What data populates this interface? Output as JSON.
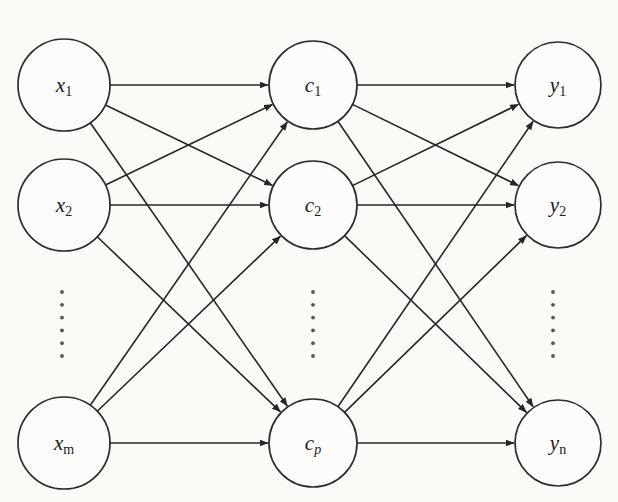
{
  "figure": {
    "background_color": "#fbfaf7",
    "stroke_color": "#262626",
    "node_fill_color": "#fdfcfa",
    "width": 618,
    "height": 502
  },
  "layers": [
    {
      "id": "input",
      "name": "input-layer",
      "center_x": 64,
      "nodes": [
        {
          "id": "x1",
          "base": "x",
          "subscript": "1",
          "sub_style": "normal",
          "cx": 64,
          "cy": 85,
          "r": 46
        },
        {
          "id": "x2",
          "base": "x",
          "subscript": "2",
          "sub_style": "normal",
          "cx": 64,
          "cy": 205,
          "r": 46
        },
        {
          "id": "xm",
          "base": "x",
          "subscript": "m",
          "sub_style": "normal",
          "cx": 64,
          "cy": 443,
          "r": 46
        }
      ],
      "ellipsis": {
        "cx": 62,
        "y_start": 292,
        "y_end": 356,
        "dots": 6
      }
    },
    {
      "id": "hidden",
      "name": "hidden-layer",
      "center_x": 313,
      "nodes": [
        {
          "id": "c1",
          "base": "c",
          "subscript": "1",
          "sub_style": "normal",
          "cx": 313,
          "cy": 85,
          "r": 44
        },
        {
          "id": "c2",
          "base": "c",
          "subscript": "2",
          "sub_style": "normal",
          "cx": 313,
          "cy": 205,
          "r": 44
        },
        {
          "id": "cp",
          "base": "c",
          "subscript": "p",
          "sub_style": "italic",
          "cx": 313,
          "cy": 443,
          "r": 44
        }
      ],
      "ellipsis": {
        "cx": 313,
        "y_start": 292,
        "y_end": 356,
        "dots": 6
      }
    },
    {
      "id": "output",
      "name": "output-layer",
      "center_x": 558,
      "nodes": [
        {
          "id": "y1",
          "base": "y",
          "subscript": "1",
          "sub_style": "normal",
          "cx": 558,
          "cy": 85,
          "r": 43
        },
        {
          "id": "y2",
          "base": "y",
          "subscript": "2",
          "sub_style": "normal",
          "cx": 558,
          "cy": 205,
          "r": 43
        },
        {
          "id": "yn",
          "base": "y",
          "subscript": "n",
          "sub_style": "normal",
          "cx": 558,
          "cy": 443,
          "r": 43
        }
      ],
      "ellipsis": {
        "cx": 553,
        "y_start": 292,
        "y_end": 356,
        "dots": 6
      }
    }
  ],
  "connections": {
    "description": "fully connected between adjacent layers",
    "input_to_hidden": [
      {
        "from": "x1",
        "to": "c1"
      },
      {
        "from": "x1",
        "to": "c2"
      },
      {
        "from": "x1",
        "to": "cp"
      },
      {
        "from": "x2",
        "to": "c1"
      },
      {
        "from": "x2",
        "to": "c2"
      },
      {
        "from": "x2",
        "to": "cp"
      },
      {
        "from": "xm",
        "to": "c1"
      },
      {
        "from": "xm",
        "to": "c2"
      },
      {
        "from": "xm",
        "to": "cp"
      }
    ],
    "hidden_to_output": [
      {
        "from": "c1",
        "to": "y1"
      },
      {
        "from": "c1",
        "to": "y2"
      },
      {
        "from": "c1",
        "to": "yn"
      },
      {
        "from": "c2",
        "to": "y1"
      },
      {
        "from": "c2",
        "to": "y2"
      },
      {
        "from": "c2",
        "to": "yn"
      },
      {
        "from": "cp",
        "to": "y1"
      },
      {
        "from": "cp",
        "to": "y2"
      },
      {
        "from": "cp",
        "to": "yn"
      }
    ]
  }
}
